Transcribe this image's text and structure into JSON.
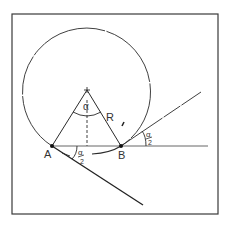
{
  "diagram": {
    "colors": {
      "line": "#2a2a2a",
      "frame": "#3a3a3a",
      "background": "#ffffff"
    },
    "frame": {
      "x": 12,
      "y": 14,
      "width": 206,
      "height": 200
    },
    "circle": {
      "cx": 87,
      "cy": 90,
      "r": 64
    },
    "center_marker": "+",
    "points": [
      {
        "id": "A",
        "label": "A",
        "x": 52,
        "y": 146
      },
      {
        "id": "B",
        "label": "B",
        "x": 121,
        "y": 146
      }
    ],
    "labels": {
      "center_angle": "α",
      "radius": "R",
      "half_angle_num": "α",
      "half_angle_den": "2",
      "point_a": "A",
      "point_b": "B"
    }
  }
}
